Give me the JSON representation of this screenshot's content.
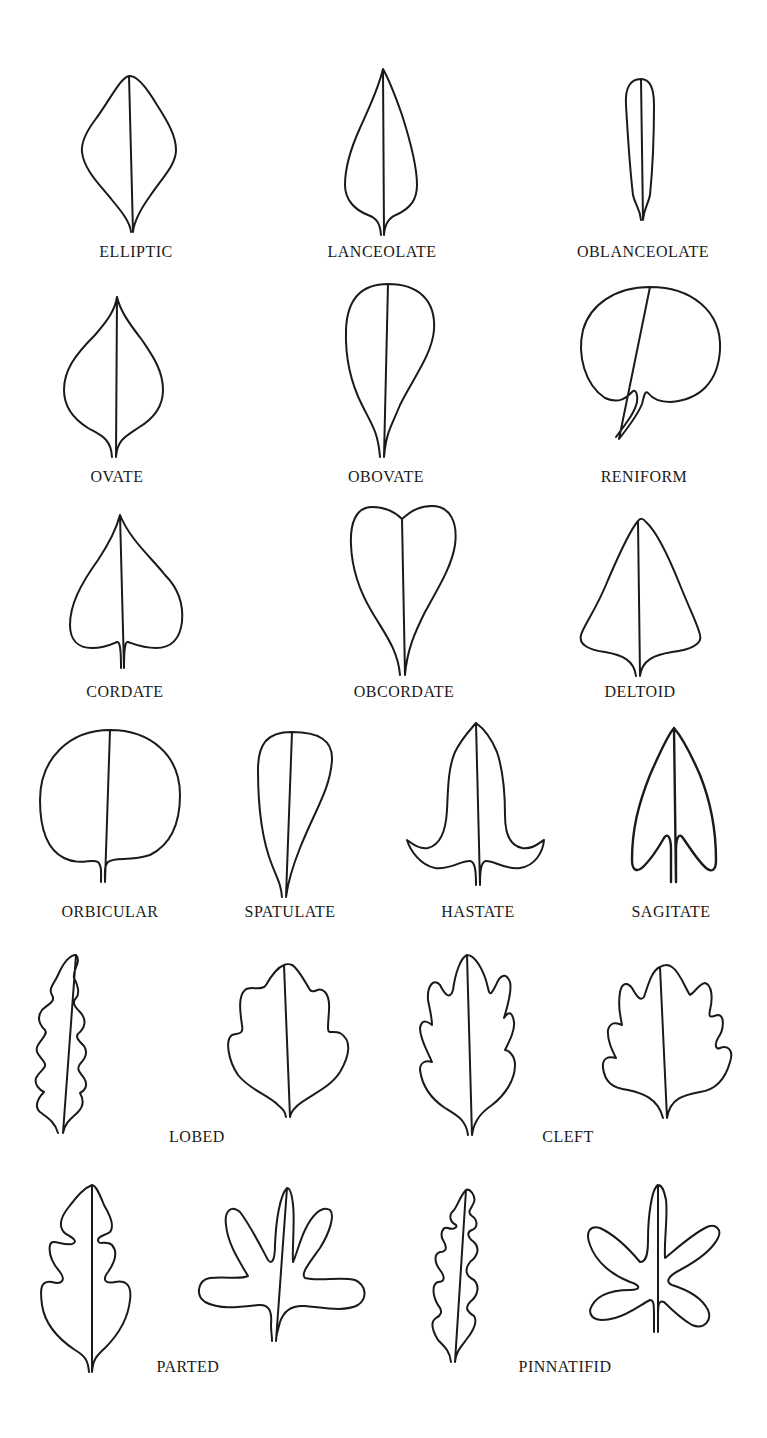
{
  "figure": {
    "title": "",
    "stroke_color": "#1a1a1a",
    "background": "#ffffff",
    "rows": [
      {
        "items": [
          {
            "id": "elliptic",
            "label": "ELLIPTIC",
            "label_x": 136,
            "label_y": 243
          },
          {
            "id": "lanceolate",
            "label": "LANCEOLATE",
            "label_x": 382,
            "label_y": 243
          },
          {
            "id": "oblanceolate",
            "label": "OBLANCEOLATE",
            "label_x": 643,
            "label_y": 243
          }
        ]
      },
      {
        "items": [
          {
            "id": "ovate",
            "label": "OVATE",
            "label_x": 117,
            "label_y": 468
          },
          {
            "id": "obovate",
            "label": "OBOVATE",
            "label_x": 386,
            "label_y": 468
          },
          {
            "id": "reniform",
            "label": "RENIFORM",
            "label_x": 644,
            "label_y": 468
          }
        ]
      },
      {
        "items": [
          {
            "id": "cordate",
            "label": "CORDATE",
            "label_x": 125,
            "label_y": 683
          },
          {
            "id": "obcordate",
            "label": "OBCORDATE",
            "label_x": 404,
            "label_y": 683
          },
          {
            "id": "deltoid",
            "label": "DELTOID",
            "label_x": 640,
            "label_y": 683
          }
        ]
      },
      {
        "items": [
          {
            "id": "orbicular",
            "label": "ORBICULAR",
            "label_x": 110,
            "label_y": 903
          },
          {
            "id": "spatulate",
            "label": "SPATULATE",
            "label_x": 290,
            "label_y": 903
          },
          {
            "id": "hastate",
            "label": "HASTATE",
            "label_x": 478,
            "label_y": 903
          },
          {
            "id": "sagitate",
            "label": "SAGITATE",
            "label_x": 671,
            "label_y": 903
          }
        ]
      },
      {
        "items": [
          {
            "id": "lobed",
            "label": "LOBED",
            "label_x": 197,
            "label_y": 1128
          },
          {
            "id": "cleft",
            "label": "CLEFT",
            "label_x": 568,
            "label_y": 1128
          }
        ]
      },
      {
        "items": [
          {
            "id": "parted",
            "label": "PARTED",
            "label_x": 188,
            "label_y": 1358
          },
          {
            "id": "pinnatifid",
            "label": "PINNATIFID",
            "label_x": 565,
            "label_y": 1358
          }
        ]
      }
    ]
  },
  "labels": {
    "elliptic": "ELLIPTIC",
    "lanceolate": "LANCEOLATE",
    "oblanceolate": "OBLANCEOLATE",
    "ovate": "OVATE",
    "obovate": "OBOVATE",
    "reniform": "RENIFORM",
    "cordate": "CORDATE",
    "obcordate": "OBCORDATE",
    "deltoid": "DELTOID",
    "orbicular": "ORBICULAR",
    "spatulate": "SPATULATE",
    "hastate": "HASTATE",
    "sagitate": "SAGITATE",
    "lobed": "LOBED",
    "cleft": "CLEFT",
    "parted": "PARTED",
    "pinnatifid": "PINNATIFID"
  }
}
